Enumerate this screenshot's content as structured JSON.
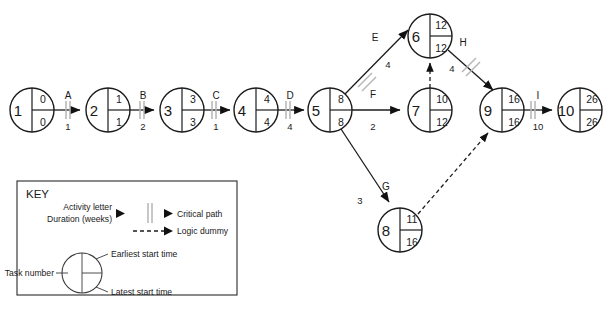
{
  "diagram": {
    "type": "activity-on-arrow-network",
    "title": "",
    "nodes": [
      {
        "id": "1",
        "task": "1",
        "earliest": "0",
        "latest": "0",
        "cx": 32,
        "cy": 110,
        "r": 22
      },
      {
        "id": "2",
        "task": "2",
        "earliest": "1",
        "latest": "1",
        "cx": 108,
        "cy": 110,
        "r": 22
      },
      {
        "id": "3",
        "task": "3",
        "earliest": "3",
        "latest": "3",
        "cx": 182,
        "cy": 110,
        "r": 22
      },
      {
        "id": "4",
        "task": "4",
        "earliest": "4",
        "latest": "4",
        "cx": 256,
        "cy": 110,
        "r": 22
      },
      {
        "id": "5",
        "task": "5",
        "earliest": "8",
        "latest": "8",
        "cx": 330,
        "cy": 110,
        "r": 22
      },
      {
        "id": "6",
        "task": "6",
        "earliest": "12",
        "latest": "12",
        "cx": 430,
        "cy": 36,
        "r": 22
      },
      {
        "id": "7",
        "task": "7",
        "earliest": "10",
        "latest": "12",
        "cx": 430,
        "cy": 110,
        "r": 22
      },
      {
        "id": "8",
        "task": "8",
        "earliest": "11",
        "latest": "16",
        "cx": 400,
        "cy": 230,
        "r": 22
      },
      {
        "id": "9",
        "task": "9",
        "earliest": "16",
        "latest": "16",
        "cx": 502,
        "cy": 110,
        "r": 22
      },
      {
        "id": "10",
        "task": "10",
        "earliest": "26",
        "latest": "26",
        "cx": 580,
        "cy": 110,
        "r": 22
      }
    ],
    "activities": [
      {
        "letter": "A",
        "duration": "1",
        "from": "1",
        "to": "2",
        "critical": true,
        "dummy": false
      },
      {
        "letter": "B",
        "duration": "2",
        "from": "2",
        "to": "3",
        "critical": true,
        "dummy": false
      },
      {
        "letter": "C",
        "duration": "1",
        "from": "3",
        "to": "4",
        "critical": true,
        "dummy": false
      },
      {
        "letter": "D",
        "duration": "4",
        "from": "4",
        "to": "5",
        "critical": true,
        "dummy": false
      },
      {
        "letter": "E",
        "duration": "4",
        "from": "5",
        "to": "6",
        "critical": true,
        "dummy": false
      },
      {
        "letter": "F",
        "duration": "2",
        "from": "5",
        "to": "7",
        "critical": false,
        "dummy": false
      },
      {
        "letter": "G",
        "duration": "3",
        "from": "5",
        "to": "8",
        "critical": false,
        "dummy": false
      },
      {
        "letter": "H",
        "duration": "4",
        "from": "6",
        "to": "9",
        "critical": true,
        "dummy": false
      },
      {
        "letter": "I",
        "duration": "10",
        "from": "9",
        "to": "10",
        "critical": true,
        "dummy": false
      },
      {
        "letter": "",
        "duration": "",
        "from": "7",
        "to": "6",
        "critical": false,
        "dummy": true
      },
      {
        "letter": "",
        "duration": "",
        "from": "8",
        "to": "9",
        "critical": false,
        "dummy": true
      }
    ]
  },
  "key": {
    "heading": "KEY",
    "activity_letter_label": "Activity letter",
    "duration_label": "Duration (weeks)",
    "critical_path_label": "Critical path",
    "logic_dummy_label": "Logic dummy",
    "task_number_label": "Task number",
    "earliest_start_label": "Earliest start time",
    "latest_start_label": "Latest start time"
  },
  "colors": {
    "ink": "#1a1a1a",
    "tick": "#b5b5b5",
    "key_stroke": "#3a3a3a",
    "background": "#ffffff"
  }
}
